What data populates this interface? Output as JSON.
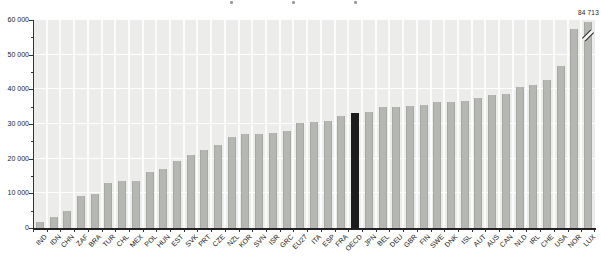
{
  "chart_data": {
    "type": "bar",
    "title": "",
    "xlabel": "",
    "ylabel": "",
    "categories": [
      "IND",
      "IDN",
      "CHN",
      "ZAF",
      "BRA",
      "TUR",
      "CHL",
      "MEX",
      "POL",
      "HUN",
      "EST",
      "SVK",
      "PRT",
      "CZE",
      "NZL",
      "KOR",
      "SVN",
      "ISR",
      "GRC",
      "EU27",
      "ITA",
      "ESP",
      "FRA",
      "OECD",
      "JPN",
      "BEL",
      "DEU",
      "GBR",
      "FIN",
      "SWE",
      "DNK",
      "ISL",
      "AUT",
      "AUS",
      "CAN",
      "NLD",
      "IRL",
      "CHE",
      "USA",
      "NOR",
      "LUX"
    ],
    "values": [
      1800,
      3100,
      4800,
      9300,
      9800,
      12900,
      13500,
      13600,
      16200,
      17000,
      19300,
      21200,
      22500,
      24000,
      26200,
      27000,
      27100,
      27300,
      28000,
      30200,
      30700,
      30900,
      32300,
      33300,
      33600,
      34800,
      34900,
      35100,
      35500,
      36300,
      36400,
      36700,
      37400,
      38300,
      38600,
      40700,
      41200,
      42700,
      46700,
      57500,
      84713
    ],
    "ylim": [
      0,
      60000
    ],
    "ytick_step": 10000,
    "ytick_labels": [
      "0",
      "10 000",
      "20 000",
      "30 000",
      "40 000",
      "50 000",
      "60 000"
    ],
    "grid": "white-on-gray",
    "legend": null,
    "bar_color": "#b5b7b3",
    "bar_edge_color": "#a6a8a4",
    "highlight": {
      "category": "OECD",
      "color": "#1c1c1c"
    },
    "plot_bg": "#ececea",
    "gridline_color": "#ffffff",
    "annotation": {
      "text": "84 713",
      "category": "LUX"
    },
    "axis_break": {
      "category": "LUX",
      "actual_value": 84713,
      "shown_value": 59500
    }
  }
}
